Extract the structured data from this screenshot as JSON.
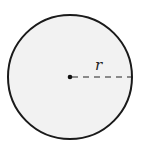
{
  "diagram": {
    "type": "circle-radius",
    "radius_label": "r",
    "fill_color": "#f2f2f2",
    "stroke_color": "#1a1a1a"
  }
}
